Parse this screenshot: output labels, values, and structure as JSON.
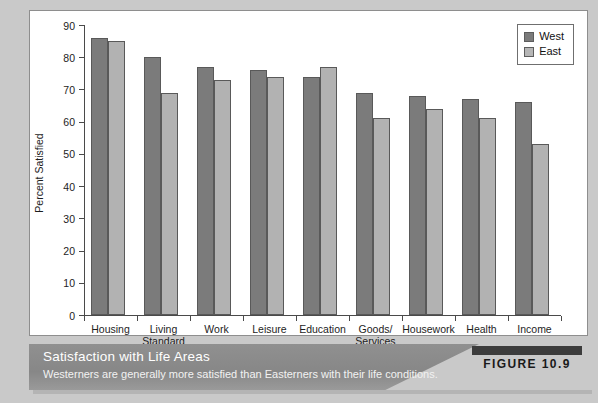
{
  "chart_data": {
    "type": "bar",
    "title": "",
    "xlabel": "",
    "ylabel": "Percent Satisfied",
    "ylim": [
      0,
      90
    ],
    "yticks": [
      0,
      10,
      20,
      30,
      40,
      50,
      60,
      70,
      80,
      90
    ],
    "grid": false,
    "legend_position": "top-right",
    "categories": [
      "Housing",
      "Living\nStandard",
      "Work",
      "Leisure",
      "Education",
      "Goods/\nServices",
      "Housework",
      "Health",
      "Income"
    ],
    "series": [
      {
        "name": "West",
        "color": "#7b7b7b",
        "values": [
          86,
          80,
          77,
          76,
          74,
          69,
          68,
          67,
          66
        ]
      },
      {
        "name": "East",
        "color": "#b2b2b2",
        "values": [
          85,
          69,
          73,
          74,
          77,
          61,
          64,
          61,
          53
        ]
      }
    ]
  },
  "legend": {
    "items": [
      {
        "label": "West"
      },
      {
        "label": "East"
      }
    ]
  },
  "caption": {
    "title": "Satisfaction with Life Areas",
    "subtitle": "Westerners are generally more satisfied than Easterners with their life conditions.",
    "figure_number": "FIGURE 10.9"
  }
}
